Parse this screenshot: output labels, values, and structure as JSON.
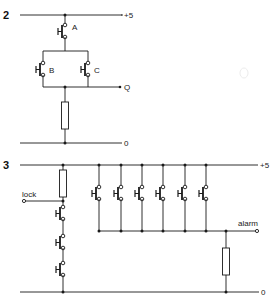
{
  "colors": {
    "ink": "#1a1a1a",
    "background": "#ffffff"
  },
  "circuit2": {
    "number": "2",
    "rail_top_label": "+5",
    "rail_bottom_label": "0",
    "output_label": "Q",
    "switches": [
      {
        "id": "A",
        "label": "A"
      },
      {
        "id": "B",
        "label": "B"
      },
      {
        "id": "C",
        "label": "C"
      }
    ]
  },
  "circuit3": {
    "number": "3",
    "rail_top_label": "+5",
    "rail_bottom_label": "0",
    "input_label": "lock",
    "output_label": "alarm",
    "series_switch_count": 3,
    "parallel_switch_count": 6
  }
}
